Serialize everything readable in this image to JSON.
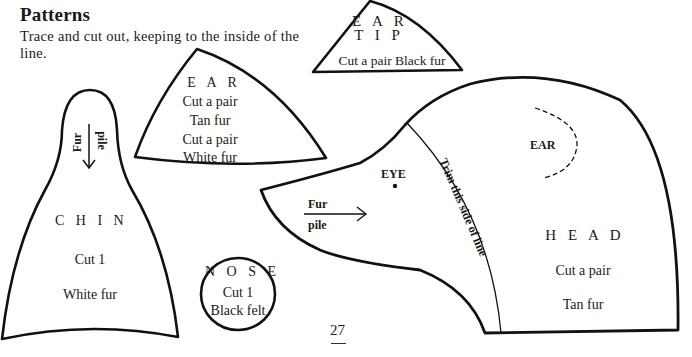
{
  "page": {
    "title": "Patterns",
    "intro": "Trace and cut out, keeping to the inside of the line.",
    "page_number": "27",
    "ink_color": "#111111",
    "paper_color": "#ffffff"
  },
  "pieces": {
    "ear_tip": {
      "name_line1": "E A R",
      "name_line2": "T I P",
      "instruction": "Cut a pair Black fur"
    },
    "ear": {
      "name": "E A R",
      "line1": "Cut a pair",
      "line2": "Tan fur",
      "line3": "Cut a pair",
      "line4": "White fur"
    },
    "chin": {
      "fur_label": "Fur",
      "pile_label": "pile",
      "name": "C H I N",
      "count": "Cut 1",
      "material": "White fur"
    },
    "nose": {
      "name": "N O S E",
      "count": "Cut 1",
      "material": "Black felt"
    },
    "head": {
      "ear_marker": "EAR",
      "eye_marker": "EYE",
      "fur_label": "Fur",
      "pile_label": "pile",
      "trim_note": "Trim this side of line",
      "name": "H E A D",
      "count": "Cut a pair",
      "material": "Tan fur"
    }
  }
}
